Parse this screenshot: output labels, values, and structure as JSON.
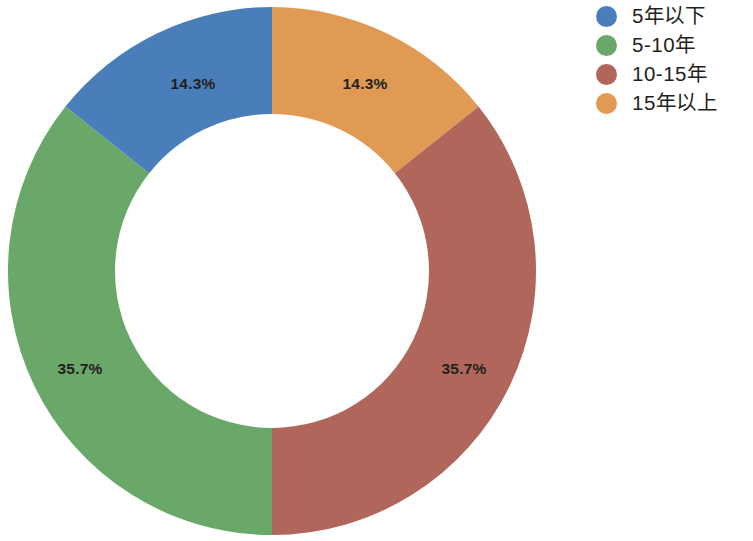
{
  "chart_data": {
    "type": "pie",
    "variant": "donut",
    "title": "",
    "subtitle": "",
    "xlabel": "",
    "ylabel": "",
    "grid": false,
    "legend_position": "right",
    "hole_ratio": 0.595,
    "start_angle_deg": 90,
    "direction": "clockwise",
    "categories": [
      "5年以下",
      "5-10年",
      "10-15年",
      "15年以上"
    ],
    "values": [
      14.3,
      35.7,
      35.7,
      14.3
    ],
    "value_labels": [
      "14.3%",
      "14.3%",
      "35.7%",
      "35.7%"
    ],
    "colors": [
      "#4a7ebb",
      "#6aa86a",
      "#b0665a",
      "#e09a54"
    ],
    "slices": [
      {
        "name": "15年以上",
        "value": 14.3,
        "label": "14.3%",
        "color": "#e09a54",
        "start_deg": 0,
        "end_deg": 51.48,
        "label_x": 365,
        "label_y": 85
      },
      {
        "name": "10-15年",
        "value": 35.7,
        "label": "35.7%",
        "color": "#b0665a",
        "start_deg": 51.48,
        "end_deg": 180,
        "label_x": 464,
        "label_y": 370
      },
      {
        "name": "5-10年",
        "value": 35.7,
        "label": "35.7%",
        "color": "#6aa86a",
        "start_deg": 180,
        "end_deg": 308.52,
        "label_x": 80,
        "label_y": 370
      },
      {
        "name": "5年以下",
        "value": 14.3,
        "label": "14.3%",
        "color": "#4a7ebb",
        "start_deg": 308.52,
        "end_deg": 360,
        "label_x": 193,
        "label_y": 85
      }
    ],
    "geometry": {
      "center_x": 272,
      "center_y": 271,
      "outer_radius": 264,
      "inner_radius": 157
    },
    "background_color": "#ffffff",
    "label_text_color": "#231f20"
  },
  "legend": {
    "items": [
      {
        "label": "5年以下",
        "color": "#4a7ebb"
      },
      {
        "label": "5-10年",
        "color": "#6aa86a"
      },
      {
        "label": "10-15年",
        "color": "#b0665a"
      },
      {
        "label": "15年以上",
        "color": "#e09a54"
      }
    ]
  }
}
